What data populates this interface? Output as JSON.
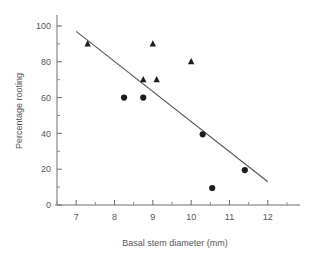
{
  "chart_data": {
    "type": "scatter",
    "title": "",
    "xlabel": "Basal stem diameter (mm)",
    "ylabel": "Percentage rooting",
    "xlim": [
      6.5,
      12.5
    ],
    "ylim": [
      0,
      105
    ],
    "xticks": [
      7,
      8,
      9,
      10,
      11,
      12
    ],
    "xticklabels": [
      "7",
      "8",
      "9",
      "10",
      "11",
      "12"
    ],
    "xminorticks": [
      6.5,
      7.5,
      8.5,
      9.5,
      10.5,
      11.5,
      12.5
    ],
    "yticks": [
      0,
      20,
      40,
      60,
      80,
      100
    ],
    "yticklabels": [
      "0",
      "20",
      "40",
      "60",
      "80",
      "100"
    ],
    "yminorticks": [
      10,
      30,
      50,
      70,
      90,
      100
    ],
    "grid": false,
    "legend": "none",
    "series": [
      {
        "name": "triangles",
        "marker": "triangle",
        "color": "#1c1c1c",
        "points": [
          {
            "x": 7.3,
            "y": 90
          },
          {
            "x": 9.0,
            "y": 90
          },
          {
            "x": 8.75,
            "y": 70
          },
          {
            "x": 9.1,
            "y": 70
          },
          {
            "x": 10.0,
            "y": 80
          }
        ]
      },
      {
        "name": "circles",
        "marker": "circle",
        "color": "#1c1c1c",
        "points": [
          {
            "x": 8.25,
            "y": 60
          },
          {
            "x": 8.75,
            "y": 60
          },
          {
            "x": 10.3,
            "y": 39.5
          },
          {
            "x": 10.55,
            "y": 9.5
          },
          {
            "x": 11.4,
            "y": 19.5
          }
        ]
      }
    ],
    "trendline": {
      "name": "regression-line",
      "color": "#555555",
      "x_start": 7.0,
      "y_start": 97,
      "x_end": 12.0,
      "y_end": 13
    }
  },
  "caption": {
    "text": ""
  }
}
